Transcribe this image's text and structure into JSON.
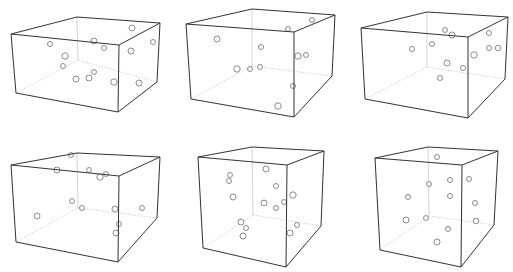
{
  "figure": {
    "edge_color": "#333333",
    "hidden_edge_color": "#c8c8c8",
    "point_stroke": "#6e6e6e",
    "point_fill": "#ffffff",
    "top_caption_clipped": ""
  },
  "panels": [
    {
      "id": "box-1",
      "corners": {
        "ftl": [
          11,
          34
        ],
        "ftr": [
          119,
          45
        ],
        "fbr": [
          118,
          112
        ],
        "fbl": [
          16,
          93
        ],
        "btl": [
          77,
          17
        ],
        "btr": [
          160,
          23
        ],
        "bbr": [
          157,
          82
        ],
        "bbl": [
          78,
          60
        ]
      },
      "points": [
        [
          132,
          28,
          3
        ],
        [
          153,
          42,
          2.5
        ],
        [
          131,
          51,
          3
        ],
        [
          50,
          44,
          2.5
        ],
        [
          94,
          41,
          3
        ],
        [
          104,
          48,
          2.5
        ],
        [
          65,
          56,
          3.2
        ],
        [
          63,
          66,
          2.5
        ],
        [
          94,
          72,
          2.5
        ],
        [
          76,
          79,
          3
        ],
        [
          89,
          78,
          3
        ],
        [
          114,
          82,
          3.2
        ],
        [
          139,
          83,
          3
        ]
      ]
    },
    {
      "id": "box-2",
      "corners": {
        "ftl": [
          186,
          24
        ],
        "ftr": [
          294,
          32
        ],
        "fbr": [
          294,
          117
        ],
        "fbl": [
          191,
          99
        ],
        "btl": [
          252,
          9
        ],
        "btr": [
          335,
          15
        ],
        "bbr": [
          332,
          76
        ],
        "bbl": [
          252,
          66
        ]
      },
      "points": [
        [
          312,
          20,
          2.5
        ],
        [
          288,
          29,
          2.5
        ],
        [
          217,
          39,
          3
        ],
        [
          261,
          47,
          2.5
        ],
        [
          298,
          56,
          3.2
        ],
        [
          306,
          55,
          2.5
        ],
        [
          237,
          69,
          3.2
        ],
        [
          250,
          69,
          2.5
        ],
        [
          260,
          67,
          2.5
        ],
        [
          293,
          86,
          2.5
        ],
        [
          278,
          106,
          3.2
        ]
      ]
    },
    {
      "id": "box-3",
      "corners": {
        "ftl": [
          361,
          28
        ],
        "ftr": [
          468,
          37
        ],
        "fbr": [
          468,
          118
        ],
        "fbl": [
          365,
          99
        ],
        "btl": [
          427,
          12
        ],
        "btr": [
          508,
          17
        ],
        "bbr": [
          505,
          79
        ],
        "bbl": [
          427,
          67
        ]
      },
      "points": [
        [
          445,
          30,
          2.5
        ],
        [
          452,
          35,
          3
        ],
        [
          489,
          33,
          2.5
        ],
        [
          412,
          49,
          2.5
        ],
        [
          432,
          44,
          2.5
        ],
        [
          489,
          48,
          2.5
        ],
        [
          498,
          48,
          2.8
        ],
        [
          474,
          55,
          3.2
        ],
        [
          447,
          63,
          3
        ],
        [
          463,
          68,
          2.5
        ],
        [
          440,
          78,
          2.5
        ]
      ]
    },
    {
      "id": "box-4",
      "corners": {
        "ftl": [
          11,
          165
        ],
        "ftr": [
          119,
          176
        ],
        "fbr": [
          118,
          262
        ],
        "fbl": [
          16,
          242
        ],
        "btl": [
          77,
          153
        ],
        "btr": [
          160,
          157
        ],
        "bbr": [
          157,
          218
        ],
        "bbl": [
          78,
          208
        ]
      },
      "points": [
        [
          71,
          155,
          2.5
        ],
        [
          57,
          170,
          3
        ],
        [
          89,
          170,
          2.5
        ],
        [
          100,
          177,
          3.2
        ],
        [
          106,
          174,
          2.5
        ],
        [
          72,
          201,
          2.5
        ],
        [
          82,
          208,
          2.5
        ],
        [
          115,
          209,
          3
        ],
        [
          142,
          208,
          2.5
        ],
        [
          37,
          216,
          3
        ],
        [
          119,
          224,
          2.5
        ],
        [
          116,
          233,
          3
        ]
      ]
    },
    {
      "id": "box-5",
      "corners": {
        "ftl": [
          198,
          157
        ],
        "ftr": [
          287,
          165
        ],
        "fbr": [
          286,
          267
        ],
        "fbl": [
          203,
          248
        ],
        "btl": [
          252,
          147
        ],
        "btr": [
          324,
          151
        ],
        "bbr": [
          321,
          226
        ],
        "bbl": [
          253,
          215
        ]
      },
      "points": [
        [
          230,
          175,
          2.5
        ],
        [
          229,
          181,
          2.5
        ],
        [
          266,
          169,
          3
        ],
        [
          276,
          186,
          2.5
        ],
        [
          233,
          197,
          3
        ],
        [
          293,
          195,
          3.2
        ],
        [
          284,
          202,
          2.5
        ],
        [
          264,
          203,
          3
        ],
        [
          276,
          208,
          2.5
        ],
        [
          241,
          222,
          3
        ],
        [
          246,
          228,
          2.5
        ],
        [
          297,
          225,
          2.5
        ],
        [
          290,
          233,
          3
        ],
        [
          243,
          236,
          3
        ]
      ]
    },
    {
      "id": "box-6",
      "corners": {
        "ftl": [
          375,
          158
        ],
        "ftr": [
          462,
          165
        ],
        "fbr": [
          461,
          267
        ],
        "fbl": [
          380,
          250
        ],
        "btl": [
          428,
          147
        ],
        "btr": [
          498,
          151
        ],
        "bbr": [
          494,
          225
        ],
        "bbl": [
          429,
          216
        ]
      },
      "points": [
        [
          437,
          157,
          2.5
        ],
        [
          429,
          184,
          2.5
        ],
        [
          450,
          180,
          2.5
        ],
        [
          469,
          179,
          2.5
        ],
        [
          408,
          197,
          2.5
        ],
        [
          450,
          196,
          2.5
        ],
        [
          475,
          203,
          2.5
        ],
        [
          406,
          220,
          3
        ],
        [
          426,
          218,
          2.5
        ],
        [
          476,
          221,
          2.8
        ],
        [
          448,
          229,
          2.5
        ],
        [
          437,
          242,
          3
        ]
      ]
    }
  ]
}
